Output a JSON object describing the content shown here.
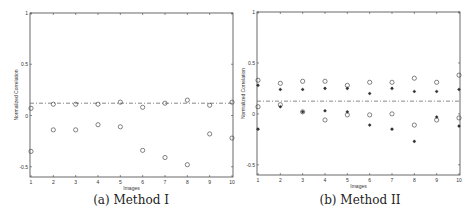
{
  "chart_data": [
    {
      "type": "scatter",
      "caption": "(a) Method I",
      "title": "",
      "xlabel": "Images",
      "ylabel": "Normalized Correlation",
      "xlim": [
        1,
        10
      ],
      "ylim": [
        -0.6,
        1
      ],
      "x_ticks": [
        1,
        2,
        3,
        4,
        5,
        6,
        7,
        8,
        9,
        10
      ],
      "y_ticks": [
        -0.5,
        0,
        0.5,
        1
      ],
      "y_tick_labels": [
        "-0.5",
        "0",
        "0.5",
        "1"
      ],
      "grid": false,
      "threshold_line": {
        "style": "dash-dot",
        "y": 0.12
      },
      "series": [
        {
          "name": "circles-upper",
          "marker": "circle",
          "x": [
            1,
            2,
            3,
            4,
            5,
            6,
            7,
            8,
            9,
            10
          ],
          "values": [
            0.07,
            0.11,
            0.11,
            0.11,
            0.13,
            0.08,
            0.12,
            0.15,
            0.1,
            0.13
          ]
        },
        {
          "name": "circles-lower",
          "marker": "circle",
          "x": [
            1,
            2,
            3,
            4,
            5,
            6,
            7,
            8,
            9,
            10
          ],
          "values": [
            -0.35,
            -0.14,
            -0.14,
            -0.09,
            -0.11,
            -0.34,
            -0.41,
            -0.48,
            -0.18,
            -0.22
          ]
        }
      ]
    },
    {
      "type": "scatter",
      "caption": "(b) Method II",
      "title": "",
      "xlabel": "Images",
      "ylabel": "Normalized Correlation",
      "xlim": [
        1,
        10
      ],
      "ylim": [
        -0.6,
        1
      ],
      "x_ticks": [
        1,
        2,
        3,
        4,
        5,
        6,
        7,
        8,
        9,
        10
      ],
      "y_ticks": [
        -0.5,
        0,
        0.5,
        1
      ],
      "y_tick_labels": [
        "-0.5",
        "0",
        "0.5",
        "1"
      ],
      "grid": false,
      "threshold_line": {
        "style": "dash-dot",
        "y": 0.125
      },
      "series": [
        {
          "name": "circles-upper",
          "marker": "circle",
          "x": [
            1,
            2,
            3,
            4,
            5,
            6,
            7,
            8,
            9,
            10
          ],
          "values": [
            0.33,
            0.3,
            0.32,
            0.32,
            0.28,
            0.31,
            0.31,
            0.35,
            0.31,
            0.38
          ]
        },
        {
          "name": "circles-lower",
          "marker": "circle",
          "x": [
            1,
            2,
            3,
            4,
            5,
            6,
            7,
            8,
            9,
            10
          ],
          "values": [
            0.07,
            0.09,
            0.02,
            -0.06,
            -0.01,
            -0.01,
            0.0,
            -0.11,
            -0.06,
            -0.04
          ]
        },
        {
          "name": "stars-upper",
          "marker": "star",
          "x": [
            1,
            2,
            3,
            4,
            5,
            6,
            7,
            8,
            9,
            10
          ],
          "values": [
            0.28,
            0.24,
            0.24,
            0.25,
            0.25,
            0.2,
            0.25,
            0.22,
            0.22,
            0.24
          ]
        },
        {
          "name": "stars-lower",
          "marker": "star",
          "x": [
            1,
            2,
            3,
            4,
            5,
            6,
            7,
            8,
            9,
            10
          ],
          "values": [
            -0.15,
            0.07,
            0.02,
            0.03,
            0.02,
            -0.11,
            -0.15,
            -0.27,
            -0.03,
            -0.12
          ]
        }
      ]
    }
  ],
  "captions": {
    "a": "(a) Method I",
    "b": "(b) Method II"
  },
  "colors": {
    "axis": "#444444",
    "marker": "#333333",
    "threshold": "#555555"
  }
}
